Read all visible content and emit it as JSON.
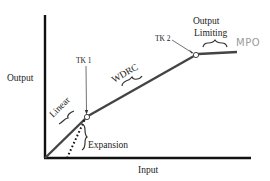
{
  "diagram": {
    "type": "hearing-aid input/output function",
    "axes": {
      "x_label": "Input",
      "y_label": "Output"
    },
    "segments": [
      {
        "name": "Linear",
        "label": "Linear"
      },
      {
        "name": "WDRC",
        "label": "WDRC"
      },
      {
        "name": "Output Limiting",
        "label_line1": "Output",
        "label_line2": "Limiting"
      },
      {
        "name": "Expansion",
        "label": "Expansion"
      }
    ],
    "kneepoints": [
      {
        "label": "TK 1"
      },
      {
        "label": "TK 2"
      }
    ],
    "annotation_mpo": "MPO",
    "colors": {
      "axis": "#111111",
      "curve": "#444444",
      "text": "#222222",
      "handwritten": "#9a9a9a"
    }
  }
}
